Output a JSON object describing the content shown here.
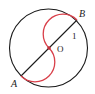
{
  "diagram": {
    "labels": {
      "A": "A",
      "B": "B",
      "O": "O",
      "radius": "1"
    },
    "colors": {
      "circle": "#1a1a1a",
      "diameter": "#1a1a1a",
      "curve": "#d9404a",
      "center_dot": "#c0303a"
    }
  }
}
